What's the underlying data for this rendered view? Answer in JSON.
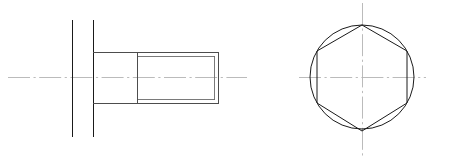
{
  "drawing": {
    "title": "Hex head bolt orthographic drawing",
    "sheet": {
      "width": 449,
      "height": 162,
      "background_color": "#ffffff"
    },
    "line_colors": {
      "visible_edge": "#1a1a1a",
      "secondary_edge": "#4d4d4d",
      "thread_minor": "#6b6b6b",
      "centerline": "#b3b3b3"
    },
    "views": [
      {
        "id": "front-view",
        "name": "Front elevation (side view of bolt)",
        "projection": "front",
        "centerline": {
          "orientation": "horizontal",
          "y": 77,
          "x_start": 8,
          "x_end": 247
        },
        "head": {
          "name": "hex head section lines",
          "left_edge_x": 72,
          "right_edge_x": 93,
          "top_y": 20,
          "bottom_y": 137
        },
        "shank": {
          "name": "unthreaded shank",
          "x_start": 93,
          "x_end": 137,
          "top_y": 52,
          "bottom_y": 103
        },
        "thread": {
          "name": "threaded portion",
          "x_start": 137,
          "x_end": 218,
          "major_top_y": 52,
          "major_bottom_y": 103,
          "minor_top_y": 56,
          "minor_bottom_y": 99,
          "end_chamfer_x": 214
        }
      },
      {
        "id": "side-view",
        "name": "End view (hex head across flats)",
        "projection": "right",
        "center_x": 362,
        "center_y": 77,
        "hexagon": {
          "name": "hex head outline",
          "orientation": "vertex-top",
          "circumradius": 53,
          "across_flats": 91,
          "vertices": [
            [
              362,
              25
            ],
            [
              407,
              51
            ],
            [
              407,
              103
            ],
            [
              362,
              131
            ],
            [
              317,
              103
            ],
            [
              317,
              51
            ]
          ]
        },
        "circle": {
          "name": "inscribed chamfer circle",
          "cx": 362,
          "cy": 77,
          "r": 52
        },
        "centerlines": [
          {
            "orientation": "horizontal",
            "y": 77,
            "x_start": 299,
            "x_end": 426
          },
          {
            "orientation": "vertical",
            "x": 362,
            "y_start": 3,
            "y_end": 158
          }
        ]
      }
    ]
  }
}
